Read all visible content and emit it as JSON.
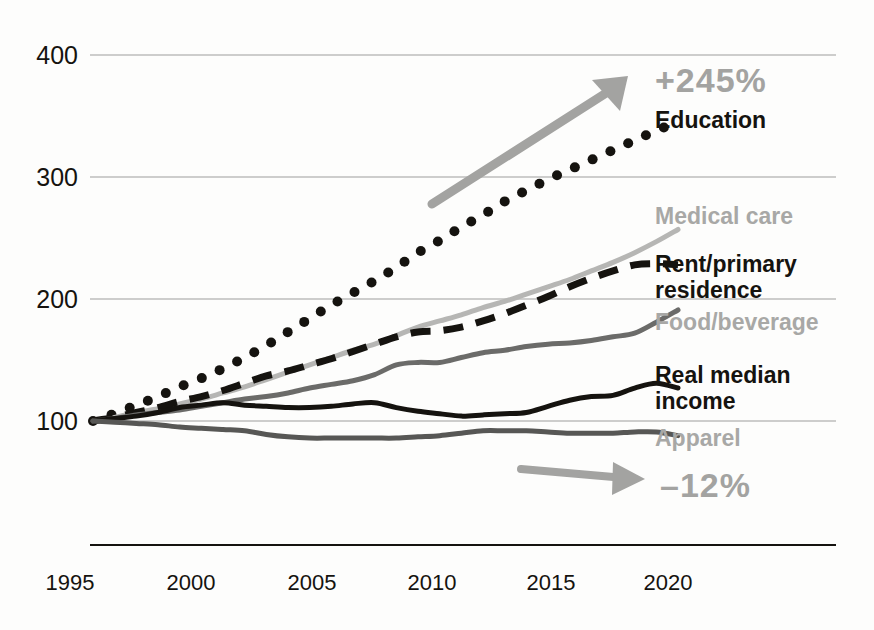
{
  "chart_data": {
    "type": "line",
    "title": "",
    "subtitle": "",
    "xlabel": "",
    "ylabel": "",
    "index_base": 100,
    "index_base_year": 1994,
    "xlim": [
      1994,
      2021
    ],
    "ylim": [
      60,
      400
    ],
    "grid": "horizontal",
    "legend_position": "right-inline",
    "x_ticks": [
      "1995",
      "2000",
      "2005",
      "2010",
      "2015",
      "2020"
    ],
    "x_tick_values": [
      1995,
      2000,
      2005,
      2010,
      2015,
      2020
    ],
    "y_ticks": [
      "100",
      "200",
      "300",
      "400"
    ],
    "y_tick_values": [
      100,
      200,
      300,
      400
    ],
    "x": [
      1994,
      1995,
      1996,
      1997,
      1998,
      1999,
      2000,
      2001,
      2002,
      2003,
      2004,
      2005,
      2006,
      2007,
      2008,
      2009,
      2010,
      2011,
      2012,
      2013,
      2014,
      2015,
      2016,
      2017,
      2018,
      2019,
      2020,
      2021
    ],
    "series": [
      {
        "name": "Education",
        "style": "dotted",
        "color": "#15130f",
        "end_value": 345,
        "values": [
          100,
          106,
          113,
          120,
          128,
          135,
          143,
          152,
          162,
          173,
          184,
          195,
          205,
          215,
          226,
          238,
          248,
          259,
          269,
          280,
          289,
          298,
          306,
          314,
          322,
          330,
          338,
          345
        ]
      },
      {
        "name": "Medical care",
        "style": "solid",
        "color": "#b6b6b4",
        "end_value": 257,
        "values": [
          100,
          103,
          107,
          110,
          114,
          118,
          123,
          128,
          134,
          140,
          146,
          152,
          158,
          163,
          170,
          177,
          182,
          187,
          193,
          198,
          204,
          210,
          216,
          223,
          230,
          238,
          247,
          257
        ]
      },
      {
        "name": "Rent/primary residence",
        "style": "dashed",
        "color": "#15130f",
        "end_value": 228,
        "values": [
          100,
          103,
          107,
          111,
          116,
          120,
          125,
          131,
          137,
          141,
          146,
          151,
          157,
          163,
          169,
          173,
          174,
          177,
          182,
          188,
          195,
          202,
          210,
          217,
          223,
          228,
          229,
          228
        ]
      },
      {
        "name": "Food/beverage",
        "style": "solid",
        "color": "#6b6b69",
        "end_value": 191,
        "values": [
          100,
          102,
          105,
          107,
          109,
          112,
          115,
          118,
          120,
          123,
          127,
          130,
          133,
          138,
          146,
          148,
          148,
          152,
          156,
          158,
          161,
          163,
          164,
          166,
          169,
          172,
          181,
          191
        ]
      },
      {
        "name": "Real median income",
        "style": "solid",
        "color": "#15130f",
        "end_value": 127,
        "values": [
          100,
          102,
          104,
          107,
          111,
          113,
          115,
          113,
          112,
          111,
          111,
          112,
          114,
          115,
          111,
          108,
          106,
          104,
          105,
          106,
          107,
          112,
          117,
          120,
          121,
          127,
          131,
          127
        ]
      },
      {
        "name": "Apparel",
        "style": "solid",
        "color": "#575755",
        "end_value": 88,
        "values": [
          100,
          99,
          98,
          97,
          95,
          94,
          93,
          92,
          89,
          87,
          86,
          86,
          86,
          86,
          86,
          87,
          88,
          90,
          92,
          92,
          92,
          91,
          90,
          90,
          90,
          91,
          91,
          88
        ]
      }
    ],
    "annotations": [
      {
        "id": "growth-callout",
        "text": "+245%",
        "color": "#a3a3a1",
        "arrow": "up-right",
        "refers_to": "Education"
      },
      {
        "id": "decline-callout",
        "text": "–12%",
        "color": "#a3a3a1",
        "arrow": "right",
        "refers_to": "Apparel"
      }
    ]
  },
  "axis": {
    "y_labels": [
      "400",
      "300",
      "200",
      "100"
    ],
    "x_labels": [
      "1995",
      "2000",
      "2005",
      "2010",
      "2015",
      "2020"
    ]
  },
  "legend": {
    "items": [
      {
        "label": "Education",
        "tone": "dark"
      },
      {
        "label": "Medical care",
        "tone": "gray"
      },
      {
        "label": "Rent/primary",
        "tone": "dark"
      },
      {
        "label": "residence",
        "tone": "dark"
      },
      {
        "label": "Food/beverage",
        "tone": "gray"
      },
      {
        "label": "Real median",
        "tone": "dark"
      },
      {
        "label": "income",
        "tone": "dark"
      },
      {
        "label": "Apparel",
        "tone": "gray"
      }
    ]
  },
  "callouts": {
    "growth": "+245%",
    "decline": "–12%"
  }
}
